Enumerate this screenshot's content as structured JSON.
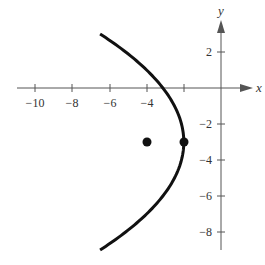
{
  "chart_data": {
    "type": "line",
    "title": "",
    "xlabel": "x",
    "ylabel": "y",
    "xlim": [
      -11,
      2.5
    ],
    "ylim": [
      -9.5,
      3.6
    ],
    "grid": false,
    "x_ticks": [
      -10,
      -8,
      -6,
      -4,
      -2
    ],
    "x_tick_labels": [
      "-10",
      "-8",
      "-6",
      "-4"
    ],
    "y_ticks": [
      2,
      -2,
      -4,
      -6,
      -8
    ],
    "y_tick_labels": [
      "2",
      "-2",
      "-4",
      "-6",
      "-8"
    ],
    "series": [
      {
        "name": "parabola",
        "equation": "(y+3)^2 = -8(x+2)",
        "vertex": [
          -2,
          -3
        ],
        "opens": "left",
        "y_range": [
          -9,
          3
        ]
      }
    ],
    "points": [
      {
        "label": "focus",
        "x": -4,
        "y": -3
      },
      {
        "label": "vertex",
        "x": -2,
        "y": -3
      }
    ]
  },
  "labels": {
    "x_axis": "x",
    "y_axis": "y",
    "x_ticks": [
      "−10",
      "−8",
      "−6",
      "−4"
    ],
    "y_ticks": [
      "2",
      "−2",
      "−4",
      "−6",
      "−8"
    ]
  }
}
